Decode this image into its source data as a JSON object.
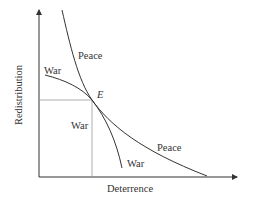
{
  "diagram": {
    "axes": {
      "x_label": "Deterrence",
      "y_label": "Redistribution"
    },
    "equilibrium_point": "E",
    "curves": [
      {
        "name": "peace-curve",
        "labels": [
          "Peace",
          "Peace"
        ]
      },
      {
        "name": "war-curve",
        "labels": [
          "War",
          "War"
        ]
      }
    ],
    "region_label": "War",
    "labels": {
      "peace_upper": "Peace",
      "peace_lower": "Peace",
      "war_upper": "War",
      "war_lower": "War",
      "war_region": "War",
      "point_e": "E"
    },
    "colors": {
      "line": "#333333",
      "guide": "#999999",
      "background": "#ffffff"
    }
  }
}
